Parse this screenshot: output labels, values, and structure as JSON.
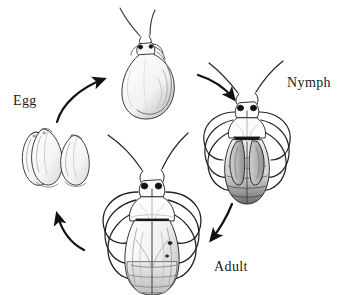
{
  "diagram": {
    "type": "life-cycle-diagram",
    "background_color": "#ffffff",
    "ink_color": "#1a1a1a",
    "width": 351,
    "height": 295,
    "labels": {
      "egg": "Egg",
      "nymph": "Nymph",
      "adult": "Adult"
    },
    "stages": [
      {
        "id": "egg",
        "label": "Egg",
        "label_position": {
          "x": 13,
          "y": 93
        },
        "illustration": "two elongated oval eggs lying side by side, pen-and-ink hatching",
        "center": {
          "x": 55,
          "y": 155
        },
        "count": 2
      },
      {
        "id": "first-instar",
        "label": "",
        "illustration": "pear-shaped early instar nymph with long antennae, no label",
        "center": {
          "x": 155,
          "y": 70
        }
      },
      {
        "id": "nymph",
        "label": "Nymph",
        "label_position": {
          "x": 287,
          "y": 75
        },
        "illustration": "late-instar nymph, dorsal view, wing pads, dark triangular scutellum, six legs, long antennae",
        "center": {
          "x": 248,
          "y": 130
        }
      },
      {
        "id": "adult",
        "label": "Adult",
        "label_position": {
          "x": 214,
          "y": 259
        },
        "illustration": "winged adult bug, dorsal view, folded hemelytra with membrane, six legs, long antennae",
        "center": {
          "x": 152,
          "y": 210
        }
      }
    ],
    "arrows": [
      {
        "id": "egg-to-first-instar",
        "from": "egg",
        "to": "first-instar",
        "direction": "up-right"
      },
      {
        "id": "first-instar-to-nymph",
        "from": "first-instar",
        "to": "nymph",
        "direction": "down-right"
      },
      {
        "id": "nymph-to-adult",
        "from": "nymph",
        "to": "adult",
        "direction": "down-left"
      },
      {
        "id": "adult-to-egg",
        "from": "adult",
        "to": "egg",
        "direction": "up-left"
      }
    ]
  }
}
